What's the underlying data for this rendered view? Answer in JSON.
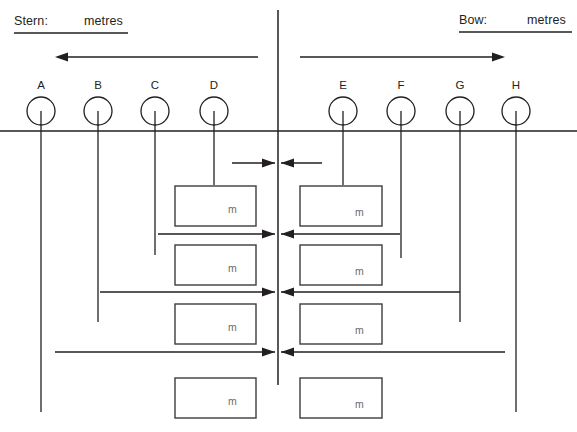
{
  "diagram": {
    "title_hidden": "",
    "stroke_color": "#231f20",
    "box_stroke_color": "#3c3c3c",
    "unit_text_color": "#6a6a6a",
    "background": "#ffffff",
    "width": 577,
    "height": 432
  },
  "header": {
    "stern": {
      "label": "Stern:",
      "unit": "metres",
      "x": 14,
      "unit_x": 84,
      "y": 14,
      "rule_x1": 14,
      "rule_x2": 128,
      "rule_y": 33
    },
    "bow": {
      "label": "Bow:",
      "unit": "metres",
      "x": 459,
      "unit_x": 527,
      "y": 13,
      "rule_x1": 459,
      "rule_x2": 572,
      "rule_y": 32
    }
  },
  "direction_arrows": [
    {
      "name": "stern-direction-arrow",
      "x_tail": 258,
      "x_head": 55,
      "y": 57,
      "dir": "left"
    },
    {
      "name": "bow-direction-arrow",
      "x_tail": 300,
      "x_head": 505,
      "y": 57,
      "dir": "right"
    }
  ],
  "baseline": {
    "y": 131,
    "x1": 0,
    "x2": 577
  },
  "centerline": {
    "x": 278,
    "y1": 10,
    "y2": 385
  },
  "nodes": [
    {
      "id": "A",
      "label": "A",
      "cx": 41,
      "cy": 111,
      "r": 14,
      "line_y2": 412,
      "side": "stern"
    },
    {
      "id": "B",
      "label": "B",
      "cx": 98,
      "cy": 111,
      "r": 14,
      "line_y2": 322,
      "side": "stern"
    },
    {
      "id": "C",
      "label": "C",
      "cx": 155,
      "cy": 111,
      "r": 14,
      "line_y2": 255,
      "side": "stern"
    },
    {
      "id": "D",
      "label": "D",
      "cx": 214,
      "cy": 111,
      "r": 14,
      "line_y2": 185,
      "side": "stern"
    },
    {
      "id": "E",
      "label": "E",
      "cx": 343,
      "cy": 111,
      "r": 14,
      "line_y2": 185,
      "side": "bow"
    },
    {
      "id": "F",
      "label": "F",
      "cx": 401,
      "cy": 111,
      "r": 14,
      "line_y2": 258,
      "side": "bow"
    },
    {
      "id": "G",
      "label": "G",
      "cx": 460,
      "cy": 111,
      "r": 14,
      "line_y2": 322,
      "side": "bow"
    },
    {
      "id": "H",
      "label": "H",
      "cx": 516,
      "cy": 111,
      "r": 14,
      "line_y2": 412,
      "side": "bow"
    }
  ],
  "measure_arrows": [
    {
      "name": "measure-arrow-1",
      "y": 163,
      "left_x": 232,
      "right_x": 322,
      "center_x": 278
    },
    {
      "name": "measure-arrow-2",
      "y": 234,
      "left_x": 158,
      "right_x": 400,
      "center_x": 278
    },
    {
      "name": "measure-arrow-3",
      "y": 292,
      "left_x": 100,
      "right_x": 460,
      "center_x": 278
    },
    {
      "name": "measure-arrow-4",
      "y": 352,
      "left_x": 55,
      "right_x": 505,
      "center_x": 278
    }
  ],
  "value_boxes": [
    {
      "name": "value-box-stern-1",
      "unit": "m",
      "x": 175,
      "y": 186,
      "w": 81,
      "h": 40,
      "unit_x": 228,
      "unit_y": 203
    },
    {
      "name": "value-box-bow-1",
      "unit": "m",
      "x": 300,
      "y": 186,
      "w": 82,
      "h": 40,
      "unit_x": 355,
      "unit_y": 206
    },
    {
      "name": "value-box-stern-2",
      "unit": "m",
      "x": 175,
      "y": 245,
      "w": 81,
      "h": 40,
      "unit_x": 228,
      "unit_y": 262
    },
    {
      "name": "value-box-bow-2",
      "unit": "m",
      "x": 300,
      "y": 245,
      "w": 82,
      "h": 40,
      "unit_x": 355,
      "unit_y": 265
    },
    {
      "name": "value-box-stern-3",
      "unit": "m",
      "x": 175,
      "y": 304,
      "w": 81,
      "h": 40,
      "unit_x": 228,
      "unit_y": 321
    },
    {
      "name": "value-box-bow-3",
      "unit": "m",
      "x": 300,
      "y": 304,
      "w": 82,
      "h": 40,
      "unit_x": 355,
      "unit_y": 324
    },
    {
      "name": "value-box-stern-4",
      "unit": "m",
      "x": 175,
      "y": 378,
      "w": 81,
      "h": 40,
      "unit_x": 228,
      "unit_y": 395
    },
    {
      "name": "value-box-bow-4",
      "unit": "m",
      "x": 300,
      "y": 378,
      "w": 82,
      "h": 40,
      "unit_x": 355,
      "unit_y": 398
    }
  ]
}
